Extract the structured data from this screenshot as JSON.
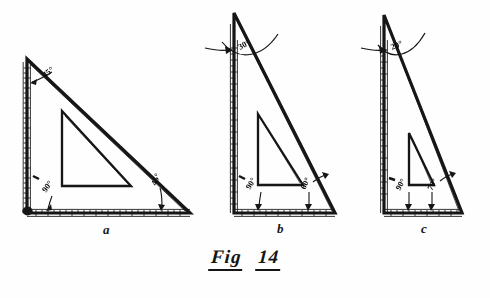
{
  "figure": {
    "caption_word1": "Fig",
    "caption_word2": "14",
    "ink_color": "#141414",
    "paper_color": "#fefefe"
  },
  "panels": [
    {
      "id": "a",
      "sub_caption": "a",
      "name": "45-degree-set-square",
      "angles": [
        {
          "label": "45°",
          "position": "upper-left"
        },
        {
          "label": "90°",
          "position": "lower-left"
        },
        {
          "label": "45°",
          "position": "lower-right"
        }
      ]
    },
    {
      "id": "b",
      "sub_caption": "b",
      "name": "30-60-set-square",
      "angles": [
        {
          "label": "30°",
          "position": "apex"
        },
        {
          "label": "90°",
          "position": "lower-left"
        },
        {
          "label": "60°",
          "position": "lower-right"
        }
      ]
    },
    {
      "id": "c",
      "sub_caption": "c",
      "name": "20-70-set-square",
      "angles": [
        {
          "label": "20°",
          "position": "apex"
        },
        {
          "label": "90°",
          "position": "lower-left"
        },
        {
          "label": "70°",
          "position": "lower-right"
        }
      ]
    }
  ]
}
